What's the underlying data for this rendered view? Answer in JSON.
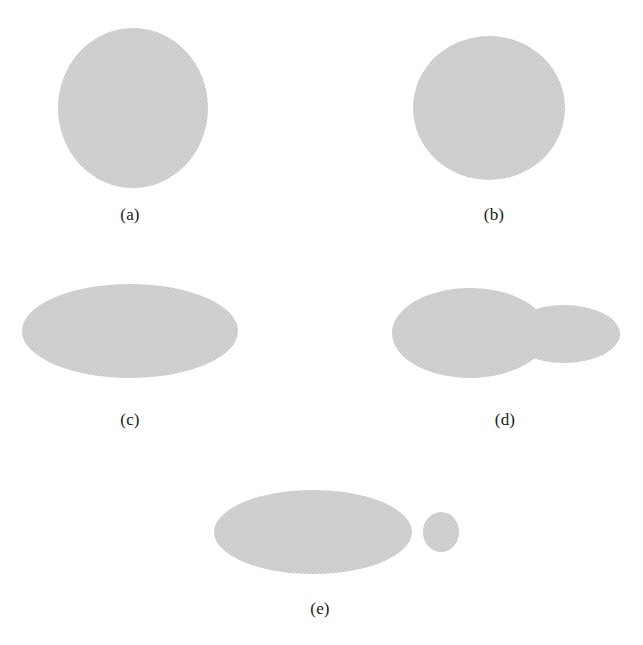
{
  "figure": {
    "width": 643,
    "height": 645,
    "background_color": "#ffffff",
    "shape_fill_color": "#cdcdcd",
    "shape_fill_texture": "halftone-dither",
    "label_color": "#1a1a1a"
  },
  "panels": [
    {
      "id": "a",
      "label": "(a)",
      "label_x": 130,
      "label_y": 205,
      "description": "single near-circular blob, slightly taller than wide",
      "shapes": [
        {
          "kind": "ellipse",
          "cx": 133,
          "cy": 108,
          "rx": 75,
          "ry": 80
        }
      ]
    },
    {
      "id": "b",
      "label": "(b)",
      "label_x": 494,
      "label_y": 205,
      "description": "single circular blob with a faint speck near upper-right edge",
      "shapes": [
        {
          "kind": "ellipse",
          "cx": 489,
          "cy": 108,
          "rx": 76,
          "ry": 72
        },
        {
          "kind": "speck",
          "cx": 541,
          "cy": 63,
          "rx": 3,
          "ry": 1.6
        }
      ]
    },
    {
      "id": "c",
      "label": "(c)",
      "label_x": 130,
      "label_y": 410,
      "description": "single wide horizontal ellipse",
      "shapes": [
        {
          "kind": "ellipse",
          "cx": 130,
          "cy": 331,
          "rx": 108,
          "ry": 47
        }
      ]
    },
    {
      "id": "d",
      "label": "(d)",
      "label_x": 505,
      "label_y": 410,
      "description": "wide ellipse fused with a smaller ellipse on the right forming a bump",
      "shapes": [
        {
          "kind": "ellipse",
          "cx": 470,
          "cy": 333,
          "rx": 78,
          "ry": 45
        },
        {
          "kind": "ellipse",
          "cx": 564,
          "cy": 334,
          "rx": 56,
          "ry": 29
        }
      ]
    },
    {
      "id": "e",
      "label": "(e)",
      "label_x": 320,
      "label_y": 599,
      "description": "wide ellipse with a separate small disconnected circle to its right",
      "shapes": [
        {
          "kind": "ellipse",
          "cx": 313,
          "cy": 532,
          "rx": 99,
          "ry": 42
        },
        {
          "kind": "ellipse",
          "cx": 441,
          "cy": 532,
          "rx": 18,
          "ry": 20
        }
      ]
    }
  ]
}
